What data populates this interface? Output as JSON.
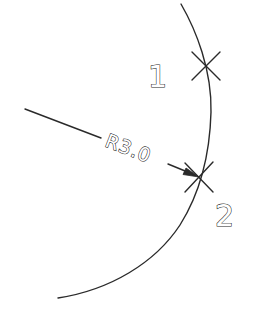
{
  "diagram": {
    "type": "cad-radius-dimension",
    "dimension": {
      "label": "R3.0",
      "radius": 3.0
    },
    "points": [
      {
        "id": "point-1",
        "label": "1"
      },
      {
        "id": "point-2",
        "label": "2"
      }
    ],
    "colors": {
      "line": "#2a2a2a",
      "background": "#ffffff"
    }
  }
}
